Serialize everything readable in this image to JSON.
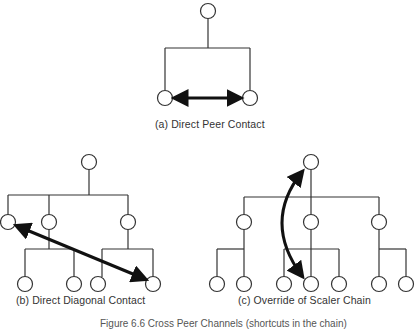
{
  "captions": {
    "a": "(a) Direct Peer Contact",
    "b": "(b) Direct Diagonal Contact",
    "c": "(c) Override of Scaler Chain",
    "figure": "Figure 6.6   Cross Peer Channels (shortcuts in the chain)"
  },
  "style": {
    "stroke": "#333333",
    "arrow": "#111111",
    "node_fill": "#ffffff"
  },
  "diagrams": [
    {
      "id": "a",
      "nodes": [
        [
          208,
          11
        ],
        [
          165,
          98
        ],
        [
          250,
          98
        ]
      ],
      "lines": [
        [
          208,
          18,
          208,
          48
        ],
        [
          165,
          48,
          250,
          48
        ],
        [
          165,
          48,
          165,
          90
        ],
        [
          250,
          48,
          250,
          90
        ]
      ],
      "arrow": {
        "type": "line",
        "x1": 175,
        "y1": 98,
        "x2": 240,
        "y2": 98
      }
    },
    {
      "id": "b",
      "nodes": [
        [
          89,
          162
        ],
        [
          8,
          222
        ],
        [
          49,
          222
        ],
        [
          128,
          222
        ],
        [
          25,
          284
        ],
        [
          74,
          284
        ],
        [
          98,
          284
        ],
        [
          153,
          284
        ]
      ],
      "lines": [
        [
          89,
          169,
          89,
          195
        ],
        [
          8,
          195,
          128,
          195
        ],
        [
          8,
          195,
          8,
          215
        ],
        [
          49,
          195,
          49,
          215
        ],
        [
          128,
          195,
          128,
          215
        ],
        [
          49,
          229,
          49,
          249
        ],
        [
          25,
          249,
          74,
          249
        ],
        [
          25,
          249,
          25,
          277
        ],
        [
          74,
          249,
          74,
          277
        ],
        [
          128,
          229,
          128,
          249
        ],
        [
          102,
          249,
          153,
          249
        ],
        [
          102,
          249,
          102,
          277
        ],
        [
          153,
          249,
          153,
          277
        ]
      ],
      "arrow": {
        "type": "line",
        "x1": 17,
        "y1": 226,
        "x2": 145,
        "y2": 279
      }
    },
    {
      "id": "c",
      "nodes": [
        [
          311,
          162
        ],
        [
          244,
          222
        ],
        [
          311,
          222
        ],
        [
          379,
          222
        ],
        [
          217,
          284
        ],
        [
          244,
          284
        ],
        [
          284,
          284
        ],
        [
          311,
          284
        ],
        [
          339,
          284
        ],
        [
          379,
          284
        ],
        [
          406,
          284
        ]
      ],
      "lines": [
        [
          311,
          169,
          311,
          215
        ],
        [
          244,
          197,
          379,
          197
        ],
        [
          244,
          197,
          244,
          215
        ],
        [
          379,
          197,
          379,
          215
        ],
        [
          244,
          229,
          244,
          277
        ],
        [
          217,
          249,
          244,
          249
        ],
        [
          217,
          249,
          217,
          277
        ],
        [
          311,
          229,
          311,
          277
        ],
        [
          284,
          249,
          339,
          249
        ],
        [
          284,
          249,
          284,
          277
        ],
        [
          339,
          249,
          339,
          277
        ],
        [
          379,
          229,
          379,
          277
        ],
        [
          379,
          249,
          406,
          249
        ],
        [
          406,
          249,
          406,
          277
        ]
      ],
      "arrow": {
        "type": "curve",
        "d": "M 302 172 Q 262 222 302 276"
      }
    }
  ]
}
